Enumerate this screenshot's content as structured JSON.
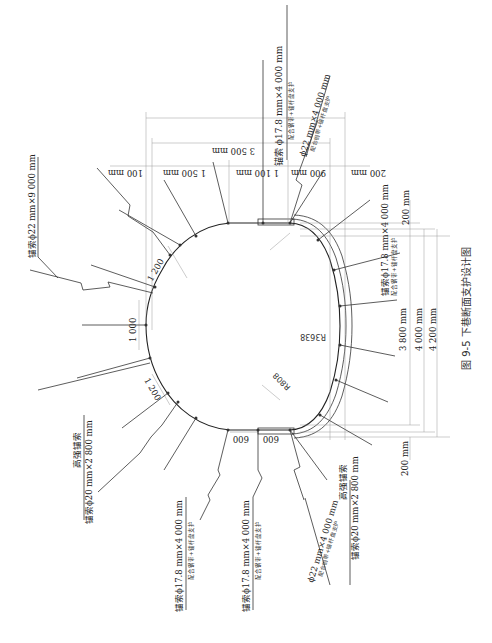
{
  "figure": {
    "caption": "图 9-5   下巷断面支护设计图"
  },
  "dimensions": {
    "top_total_1": "3 500 mm",
    "top_seg_100": "100 mm",
    "top_seg_1500": "1 500 mm",
    "top_seg_1100": "1 100 mm",
    "top_seg_900": "900 mm",
    "top_seg_200": "200 mm",
    "right_200_top": "200 mm",
    "right_3800": "3 800  mm",
    "right_4000": "4 000  mm",
    "right_4200": "4 200  mm",
    "right_200_bottom": "200 mm",
    "arch_1200_upper": "1 200",
    "arch_1000": "1 000",
    "arch_1200_lower": "1 200",
    "bottom_600_a": "600",
    "bottom_600_b": "600",
    "radius_large": "R3638",
    "radius_small": "R808"
  },
  "labels": {
    "anchor_cable_22x9000": "锚索ϕ22  mm×9 000 mm",
    "anchor_cable_top_main": "锚索  ϕ17.8  mm×4 000 mm",
    "anchor_cable_top_sub": "配合钢带+锚杆盘支护",
    "bolt_22_top_main": "ϕ22  mm×4 000 mm",
    "bolt_22_top_sub": "配合钢带+锚杆盘支护",
    "anchor_right_main": "锚索ϕ17.8  mm×4 000 mm",
    "anchor_right_sub": "配合钢带+锚杆盘支护",
    "hs_anchor_left_title": "高强锚索",
    "hs_anchor_left_spec": "锚索ϕ20  mm×2 800 mm",
    "hs_anchor_right_title": "高强锚索",
    "hs_anchor_right_spec": "锚索ϕ20  mm×2 800 mm",
    "anchor_bottom_a_main": "锚索ϕ17.8  mm×4 000 mm",
    "anchor_bottom_a_sub": "配合钢带+锚杆盘支护",
    "anchor_bottom_b_main": "锚索ϕ17.8  mm×4 000 mm",
    "anchor_bottom_b_sub": "配合钢带+锚杆盘支护",
    "bolt_22_bottom_main": "ϕ22  mm×4 000 mm",
    "bolt_22_bottom_sub": "配合钢带+锚杆盘支护"
  }
}
